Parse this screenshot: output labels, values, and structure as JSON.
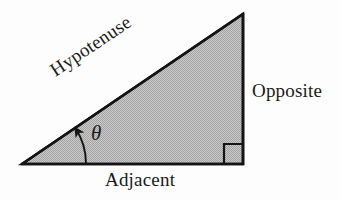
{
  "figure": {
    "type": "geometry-diagram",
    "canvas": {
      "width": 340,
      "height": 200,
      "background": "#fdfdfd"
    },
    "shape": {
      "name": "right-triangle",
      "fill_color": "#b9b9b9",
      "stroke_color": "#141414",
      "stroke_width": 2.6,
      "vertices": [
        {
          "name": "angle-vertex",
          "x": 22,
          "y": 164
        },
        {
          "name": "apex-vertex",
          "x": 243,
          "y": 14
        },
        {
          "name": "right-angle-vertex",
          "x": 243,
          "y": 164
        }
      ],
      "sides": [
        {
          "name": "hypotenuse",
          "from": "angle-vertex",
          "to": "apex-vertex"
        },
        {
          "name": "opposite",
          "from": "apex-vertex",
          "to": "right-angle-vertex"
        },
        {
          "name": "adjacent",
          "from": "right-angle-vertex",
          "to": "angle-vertex"
        }
      ]
    },
    "right_angle_marker": {
      "name": "right-angle-square",
      "x": 224,
      "y": 144,
      "size": 20,
      "stroke_color": "#141414"
    },
    "angle_arc": {
      "name": "angle-arc-arrow",
      "vertex_x": 22,
      "vertex_y": 164,
      "radius": 64,
      "start_deg": 0,
      "end_deg": 34,
      "arrow": "arrowhead-at-hypotenuse",
      "stroke_color": "#141414"
    },
    "labels": {
      "hypotenuse": "Hypotenuse",
      "opposite": "Opposite",
      "adjacent": "Adjacent",
      "theta": "θ"
    },
    "label_rotation_deg": {
      "hypotenuse": -33.8
    }
  }
}
